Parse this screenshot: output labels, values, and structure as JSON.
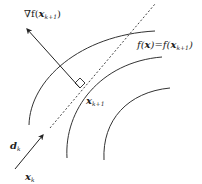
{
  "diagram": {
    "type": "level-set-gradient-descent",
    "labels": {
      "gradient": {
        "prefix": "∇f(",
        "var": "x",
        "sub": "k+1",
        "suffix": ")"
      },
      "level_set": {
        "lhs_f": "f(",
        "lhs_var": "x",
        "mid": ")=f(",
        "rhs_var": "x",
        "rhs_sub": "k+1",
        "suffix": ")"
      },
      "point": {
        "var": "x",
        "sub": "k+1"
      },
      "direction": {
        "var": "d",
        "sub": "k"
      },
      "start": {
        "var": "x",
        "sub": "k"
      }
    },
    "colors": {
      "stroke": "#222222",
      "background": "#ffffff"
    }
  }
}
